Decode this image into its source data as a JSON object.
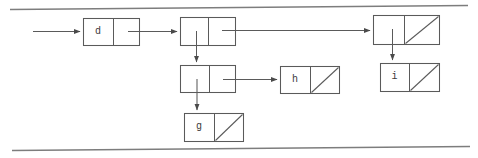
{
  "diagram": {
    "stroke_color": "#5a5a5a",
    "page_edge_color": "#7a7a7a",
    "label_color": "#3a3a3a",
    "background": "#ffffff",
    "nodes": [
      {
        "id": "node-d",
        "label": "d",
        "right_cell_label": "",
        "left_cell_null": false,
        "right_cell_null": false,
        "x": 83,
        "y": 18,
        "width": 57,
        "height": 28
      },
      {
        "id": "node-top-middle",
        "label": "",
        "right_cell_label": "",
        "left_cell_null": false,
        "right_cell_null": false,
        "x": 180,
        "y": 17,
        "width": 56,
        "height": 29
      },
      {
        "id": "node-top-right",
        "label": "",
        "right_cell_label": "",
        "left_cell_null": false,
        "right_cell_null": true,
        "x": 373,
        "y": 15,
        "width": 67,
        "height": 30
      },
      {
        "id": "node-mid-left",
        "label": "",
        "right_cell_label": "",
        "left_cell_null": false,
        "right_cell_null": false,
        "x": 180,
        "y": 65,
        "width": 56,
        "height": 28
      },
      {
        "id": "node-h",
        "label": "h",
        "right_cell_label": "",
        "left_cell_null": false,
        "right_cell_null": true,
        "x": 280,
        "y": 66,
        "width": 60,
        "height": 28
      },
      {
        "id": "node-i",
        "label": "i",
        "right_cell_label": "",
        "left_cell_null": false,
        "right_cell_null": true,
        "x": 380,
        "y": 63,
        "width": 60,
        "height": 29
      },
      {
        "id": "node-g",
        "label": "g",
        "right_cell_label": "",
        "left_cell_null": false,
        "right_cell_null": true,
        "x": 184,
        "y": 113,
        "width": 60,
        "height": 29
      }
    ],
    "edges": [
      {
        "id": "edge-entry-to-d",
        "from": "entry-point",
        "to": "node-d",
        "orientation": "horizontal"
      },
      {
        "id": "edge-d-to-top-middle",
        "from": "node-d",
        "to": "node-top-middle",
        "orientation": "horizontal"
      },
      {
        "id": "edge-top-middle-to-right",
        "from": "node-top-middle",
        "to": "node-top-right",
        "orientation": "horizontal"
      },
      {
        "id": "edge-top-middle-to-mid",
        "from": "node-top-middle",
        "to": "node-mid-left",
        "orientation": "vertical"
      },
      {
        "id": "edge-mid-to-h",
        "from": "node-mid-left",
        "to": "node-h",
        "orientation": "horizontal"
      },
      {
        "id": "edge-mid-to-g",
        "from": "node-mid-left",
        "to": "node-g",
        "orientation": "vertical"
      },
      {
        "id": "edge-top-right-to-i",
        "from": "node-top-right",
        "to": "node-i",
        "orientation": "vertical"
      }
    ],
    "page_edges": [
      {
        "id": "page-edge-top",
        "x1": 10,
        "y1": 9,
        "x2": 468,
        "y2": 5
      },
      {
        "id": "page-edge-bottom",
        "x1": 12,
        "y1": 150,
        "x2": 470,
        "y2": 146
      }
    ]
  }
}
